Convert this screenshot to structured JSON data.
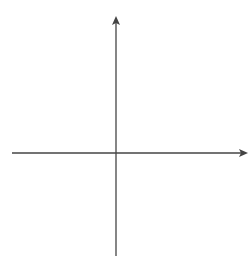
{
  "chart_data": {
    "type": "line",
    "title": "",
    "xlabel": "x",
    "ylabel": "y",
    "xlim": [
      -6,
      6
    ],
    "ylim": [
      -5,
      6
    ],
    "grid": true,
    "grid_style": "dotted",
    "tick_labels": false,
    "series": [
      {
        "name": "4x − 3y = 12",
        "equation": "4x - 3y = 12",
        "slope": 1.3333,
        "y_intercept": -4,
        "x_intercept": 3,
        "x": [
          -1.2,
          0,
          3,
          6
        ],
        "y": [
          -5.6,
          -4,
          0,
          4
        ]
      }
    ],
    "annotations": [
      {
        "text": "4x − 3y = 12",
        "position": "upper right, above line"
      }
    ]
  },
  "labels": {
    "x_axis": "x",
    "y_axis": "y",
    "equation_parts": {
      "a": "4",
      "var1": "x",
      "op": " − ",
      "b": "3",
      "var2": "y",
      "eq": " = 12"
    }
  },
  "colors": {
    "line": "#222222",
    "axis": "#444444",
    "grid": "#9a9a9a"
  }
}
